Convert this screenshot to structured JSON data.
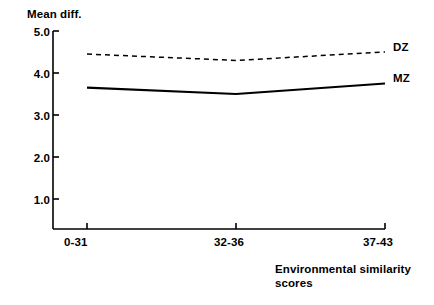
{
  "chart_data": {
    "type": "line",
    "title": "",
    "ylabel": "Mean diff.",
    "xlabel": "Environmental similarity scores",
    "xlabel_line1": "Environmental similarity",
    "xlabel_line2": "scores",
    "categories": [
      "0-31",
      "32-36",
      "37-43"
    ],
    "yticks": [
      "5.0",
      "4.0",
      "3.0",
      "2.0",
      "1.0"
    ],
    "ytick_values": [
      5.0,
      4.0,
      3.0,
      2.0,
      1.0
    ],
    "ylim": [
      0.0,
      5.0
    ],
    "grid": false,
    "legend_position": "right-inline",
    "series": [
      {
        "name": "DZ",
        "style": "dashed",
        "color": "#000000",
        "values": [
          4.45,
          4.3,
          4.5
        ]
      },
      {
        "name": "MZ",
        "style": "solid",
        "color": "#000000",
        "values": [
          3.65,
          3.5,
          3.75
        ]
      }
    ]
  },
  "axis": {
    "y_title": "Mean diff.",
    "x_title_line1": "Environmental similarity",
    "x_title_line2": "scores"
  },
  "ticks": {
    "y": [
      {
        "label": "5.0",
        "value": 5.0
      },
      {
        "label": "4.0",
        "value": 4.0
      },
      {
        "label": "3.0",
        "value": 3.0
      },
      {
        "label": "2.0",
        "value": 2.0
      },
      {
        "label": "1.0",
        "value": 1.0
      }
    ],
    "x": [
      {
        "label": "0-31"
      },
      {
        "label": "32-36"
      },
      {
        "label": "37-43"
      }
    ]
  },
  "legend": {
    "dz": "DZ",
    "mz": "MZ"
  }
}
